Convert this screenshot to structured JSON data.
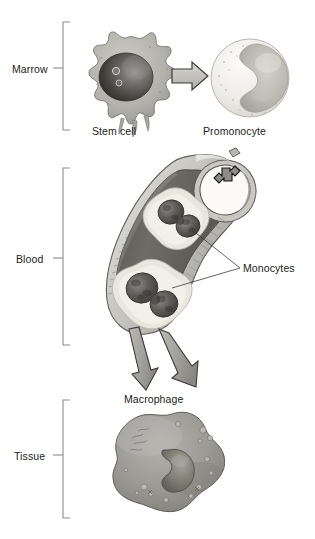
{
  "figure": {
    "width": 315,
    "height": 539,
    "background": "#ffffff"
  },
  "stages": [
    {
      "id": "marrow",
      "label": "Marrow",
      "bracket_top": 22,
      "bracket_bottom": 130,
      "tick_y": 68
    },
    {
      "id": "blood",
      "label": "Blood",
      "bracket_top": 168,
      "bracket_bottom": 345,
      "tick_y": 258
    },
    {
      "id": "tissue",
      "label": "Tissue",
      "bracket_top": 400,
      "bracket_bottom": 518,
      "tick_y": 455
    }
  ],
  "cells": {
    "stem_cell": {
      "label": "Stem cell",
      "cytoplasm_color": "#b4b2ad",
      "nucleus_color": "#4a4a48",
      "nucleoli_count": 2
    },
    "promonocyte": {
      "label": "Promonocyte",
      "cytoplasm_color": "#eceae6",
      "nucleus_color": "#b9b7b2"
    },
    "monocytes": {
      "label": "Monocytes",
      "count": 2,
      "cytoplasm_color": "#e4e1d7",
      "nucleus_color": "#5b5956"
    },
    "macrophage": {
      "label": "Macrophage",
      "cytoplasm_color": "#9c9a96",
      "nucleus_color": "#77756f"
    }
  },
  "vessel": {
    "name": "blood-vessel",
    "wall_color": "#c8c6c1",
    "lumen_color": "#6f6d6a",
    "opening_color": "#fbfaf7"
  },
  "arrows": {
    "differentiation": {
      "name": "stem-to-promonocyte-arrow",
      "direction": "right",
      "fill": "#c9c7c2",
      "stroke": "#3a3a38"
    },
    "entering_vessel": {
      "name": "monocyte-entering-vessel-arrow",
      "direction": "down-left",
      "fill": "#8e8c88",
      "stroke": "#1d1d1b"
    },
    "exit_left": {
      "name": "vessel-exit-arrow-left",
      "direction": "down-left",
      "fill": "#a9a7a2",
      "stroke": "#3a3a38"
    },
    "exit_right": {
      "name": "vessel-exit-arrow-right",
      "direction": "down-right",
      "fill": "#a9a7a2",
      "stroke": "#3a3a38"
    }
  },
  "colors": {
    "text": "#222222",
    "bracket": "#8c8c8c",
    "leader_line": "#3a3a38"
  }
}
